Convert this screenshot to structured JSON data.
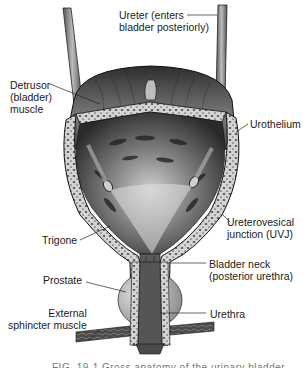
{
  "figure": {
    "type": "anatomical-diagram",
    "caption_partial": "FIG. 19-1 Gross anatomy of the urinary bladder"
  },
  "labels": {
    "ureter": "Ureter (enters\nbladder posteriorly)",
    "detrusor": "Detrusor\n(bladder)\nmuscle",
    "urothelium": "Urothelium",
    "uvj": "Ureterovesical\njunction (UVJ)",
    "trigone": "Trigone",
    "bladder_neck": "Bladder neck\n(posterior urethra)",
    "prostate": "Prostate",
    "urethra": "Urethra",
    "external_sphincter": "External\nsphincter muscle"
  },
  "colors": {
    "ink": "#1a1a1a",
    "muscle_dark": "#3a3a3a",
    "muscle_mid": "#6a6a6a",
    "wall_light": "#c8c8c8",
    "prostate": "#bdbdbd",
    "background": "#ffffff"
  }
}
